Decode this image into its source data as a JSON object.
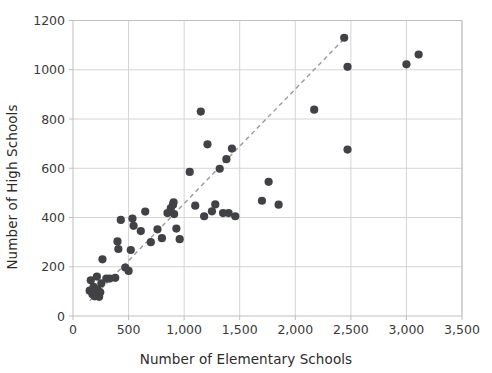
{
  "chart_data": {
    "type": "scatter",
    "title": "",
    "xlabel": "Number of Elementary Schools",
    "ylabel": "Number of High Schools",
    "xlim": [
      0,
      3500
    ],
    "ylim": [
      0,
      1200
    ],
    "xticks": [
      0,
      500,
      1000,
      1500,
      2000,
      2500,
      3000,
      3500
    ],
    "xticklabels": [
      "0",
      "500",
      "1,000",
      "1,500",
      "2,000",
      "2,500",
      "3,000",
      "3,500"
    ],
    "yticks": [
      0,
      200,
      400,
      600,
      800,
      1000,
      1200
    ],
    "yticklabels": [
      "0",
      "200",
      "400",
      "600",
      "800",
      "1000",
      "1200"
    ],
    "grid": true,
    "legend": "none",
    "marker_color": "#414247",
    "marker_size": 5.6,
    "grid_color": "#d4d4d4",
    "axis_color": "#bfbfbf",
    "tick_label_color": "#3a3a3a",
    "trendline": {
      "style": "dashed",
      "color": "#9a9a9a",
      "x0": 150,
      "y0": 62,
      "x1": 2470,
      "y1": 1140
    },
    "points": [
      {
        "x": 150,
        "y": 103
      },
      {
        "x": 160,
        "y": 145
      },
      {
        "x": 175,
        "y": 88
      },
      {
        "x": 185,
        "y": 118
      },
      {
        "x": 195,
        "y": 80
      },
      {
        "x": 205,
        "y": 95
      },
      {
        "x": 215,
        "y": 160
      },
      {
        "x": 220,
        "y": 108
      },
      {
        "x": 228,
        "y": 86
      },
      {
        "x": 235,
        "y": 78
      },
      {
        "x": 245,
        "y": 96
      },
      {
        "x": 255,
        "y": 133
      },
      {
        "x": 265,
        "y": 230
      },
      {
        "x": 300,
        "y": 152
      },
      {
        "x": 330,
        "y": 152
      },
      {
        "x": 380,
        "y": 155
      },
      {
        "x": 400,
        "y": 303
      },
      {
        "x": 408,
        "y": 272
      },
      {
        "x": 430,
        "y": 390
      },
      {
        "x": 470,
        "y": 197
      },
      {
        "x": 500,
        "y": 183
      },
      {
        "x": 520,
        "y": 268
      },
      {
        "x": 535,
        "y": 396
      },
      {
        "x": 545,
        "y": 366
      },
      {
        "x": 610,
        "y": 345
      },
      {
        "x": 650,
        "y": 424
      },
      {
        "x": 700,
        "y": 300
      },
      {
        "x": 760,
        "y": 352
      },
      {
        "x": 800,
        "y": 316
      },
      {
        "x": 850,
        "y": 418
      },
      {
        "x": 880,
        "y": 438
      },
      {
        "x": 900,
        "y": 452
      },
      {
        "x": 905,
        "y": 462
      },
      {
        "x": 910,
        "y": 414
      },
      {
        "x": 930,
        "y": 355
      },
      {
        "x": 960,
        "y": 312
      },
      {
        "x": 1050,
        "y": 585
      },
      {
        "x": 1100,
        "y": 448
      },
      {
        "x": 1150,
        "y": 830
      },
      {
        "x": 1180,
        "y": 405
      },
      {
        "x": 1210,
        "y": 697
      },
      {
        "x": 1250,
        "y": 425
      },
      {
        "x": 1280,
        "y": 453
      },
      {
        "x": 1320,
        "y": 598
      },
      {
        "x": 1350,
        "y": 418
      },
      {
        "x": 1380,
        "y": 637
      },
      {
        "x": 1400,
        "y": 418
      },
      {
        "x": 1430,
        "y": 680
      },
      {
        "x": 1460,
        "y": 405
      },
      {
        "x": 1700,
        "y": 468
      },
      {
        "x": 1760,
        "y": 545
      },
      {
        "x": 1850,
        "y": 452
      },
      {
        "x": 2170,
        "y": 838
      },
      {
        "x": 2440,
        "y": 1130
      },
      {
        "x": 2470,
        "y": 1012
      },
      {
        "x": 2470,
        "y": 676
      },
      {
        "x": 3000,
        "y": 1022
      },
      {
        "x": 3110,
        "y": 1062
      }
    ]
  }
}
